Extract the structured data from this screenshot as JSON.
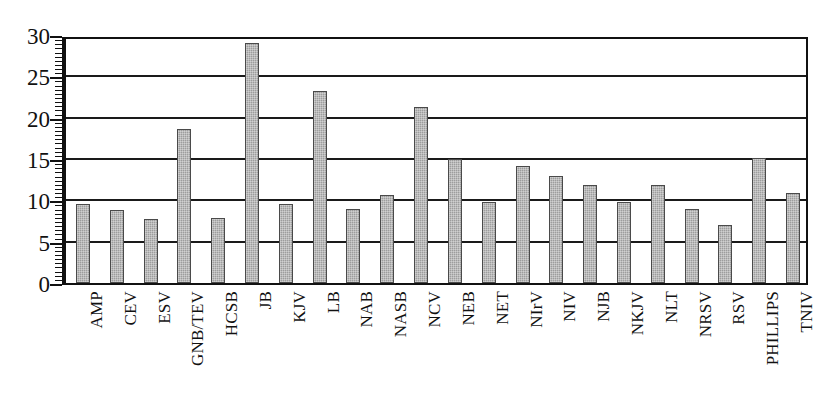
{
  "chart_data": {
    "type": "bar",
    "title": "",
    "subtitle": "",
    "xlabel": "",
    "ylabel": "",
    "ylim": [
      0,
      30
    ],
    "ytick_step": 5,
    "yticks": [
      0,
      5,
      10,
      15,
      20,
      25,
      30
    ],
    "ytick_labels": [
      "0",
      "5",
      "10",
      "15",
      "20",
      "25",
      "30"
    ],
    "minor_tick_step": 1,
    "grid": true,
    "grid_axis": "y",
    "legend": false,
    "legend_position": "none",
    "bar_color": "#9d9d9d",
    "bar_edge_color": "#4a4a4a",
    "axis_color": "#111111",
    "background_color": "#ffffff",
    "categories": [
      "AMP",
      "CEV",
      "ESV",
      "GNB/TEV",
      "HCSB",
      "JB",
      "KJV",
      "LB",
      "NAB",
      "NASB",
      "NCV",
      "NEB",
      "NET",
      "NIrV",
      "NIV",
      "NJB",
      "NKJV",
      "NLT",
      "NRSV",
      "RSV",
      "PHILLIPS",
      "TNIV"
    ],
    "values": [
      9.5,
      8.8,
      7.8,
      18.6,
      7.9,
      29.0,
      9.6,
      23.2,
      8.9,
      10.7,
      21.3,
      15.0,
      9.8,
      14.1,
      13.0,
      11.8,
      9.8,
      11.8,
      9.0,
      7.0,
      15.1,
      10.9
    ]
  }
}
